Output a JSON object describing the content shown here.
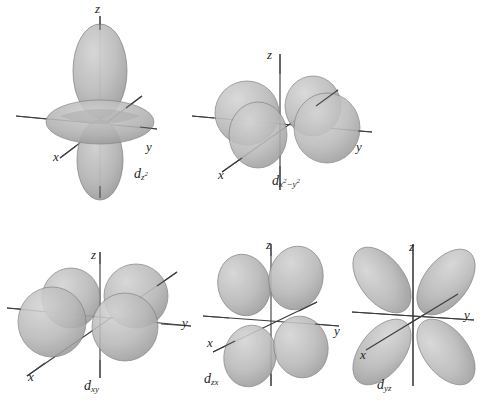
{
  "figure": {
    "background_color": "#ffffff",
    "lobe_fill_color": "#b5b5b5",
    "lobe_edge_color": "#6e6e6e",
    "axis_line_color": "#3b3b3b",
    "text_color": "#1f1f1f",
    "axis_labels": {
      "x": "x",
      "y": "y",
      "z": "z"
    }
  },
  "orbitals": [
    {
      "id": "dz2",
      "name": "d-z-squared",
      "label_main": "d",
      "label_sub": "z",
      "label_sub_exp": "2",
      "row": 1,
      "column": 1,
      "shape": "two-lobes-along-z-with-torus",
      "axes": {
        "x": "x",
        "y": "y",
        "z": "z"
      }
    },
    {
      "id": "dx2-y2",
      "name": "d-x-squared-minus-y-squared",
      "label_main": "d",
      "label_sub": "x",
      "label_sub_exp": "2",
      "label_sub_2": "−y",
      "label_sub_exp_2": "2",
      "row": 1,
      "column": 2,
      "shape": "four-lobes-along-x-and-y",
      "axes": {
        "x": "x",
        "y": "y",
        "z": "z"
      }
    },
    {
      "id": "dxy",
      "name": "d-xy",
      "label_main": "d",
      "label_sub": "xy",
      "row": 2,
      "column": 1,
      "shape": "four-lobes-between-x-and-y",
      "axes": {
        "x": "x",
        "y": "y",
        "z": "z"
      }
    },
    {
      "id": "dzx",
      "name": "d-zx",
      "label_main": "d",
      "label_sub": "zx",
      "row": 2,
      "column": 2,
      "shape": "four-lobes-between-z-and-x",
      "axes": {
        "x": "x",
        "y": "y",
        "z": "z"
      }
    },
    {
      "id": "dyz",
      "name": "d-yz",
      "label_main": "d",
      "label_sub": "yz",
      "row": 2,
      "column": 3,
      "shape": "four-lobes-between-y-and-z",
      "axes": {
        "x": "x",
        "y": "y",
        "z": "z"
      }
    }
  ]
}
